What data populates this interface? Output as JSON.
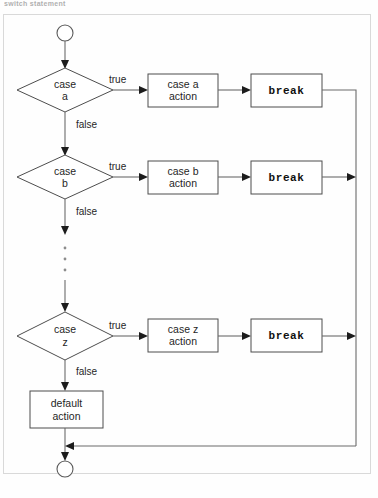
{
  "page": {
    "header_text": "switch statement",
    "background_color": "#fefefe",
    "frame_color": "#d9d9d9"
  },
  "diagram": {
    "type": "flowchart",
    "line_color": "#6b6b6b",
    "node_stroke_color": "#4d4d4d",
    "node_fill_color": "#ffffff",
    "text_color": "#1f1f1f",
    "start_node": {
      "name": "start",
      "shape": "circle",
      "label": ""
    },
    "end_node": {
      "name": "end",
      "shape": "circle",
      "label": ""
    },
    "branches": [
      {
        "id": "a",
        "decision_line1": "case",
        "decision_line2": "a",
        "true_label": "true",
        "false_label": "false",
        "action_line1": "case a",
        "action_line2": "action",
        "break_label": "break"
      },
      {
        "id": "b",
        "decision_line1": "case",
        "decision_line2": "b",
        "true_label": "true",
        "false_label": "false",
        "action_line1": "case b",
        "action_line2": "action",
        "break_label": "break"
      },
      {
        "id": "z",
        "decision_line1": "case",
        "decision_line2": "z",
        "true_label": "true",
        "false_label": "false",
        "action_line1": "case z",
        "action_line2": "action",
        "break_label": "break"
      }
    ],
    "ellipsis": {
      "name": "vertical-ellipsis",
      "dot_count": 3
    },
    "default_node": {
      "line1": "default",
      "line2": "action"
    }
  }
}
